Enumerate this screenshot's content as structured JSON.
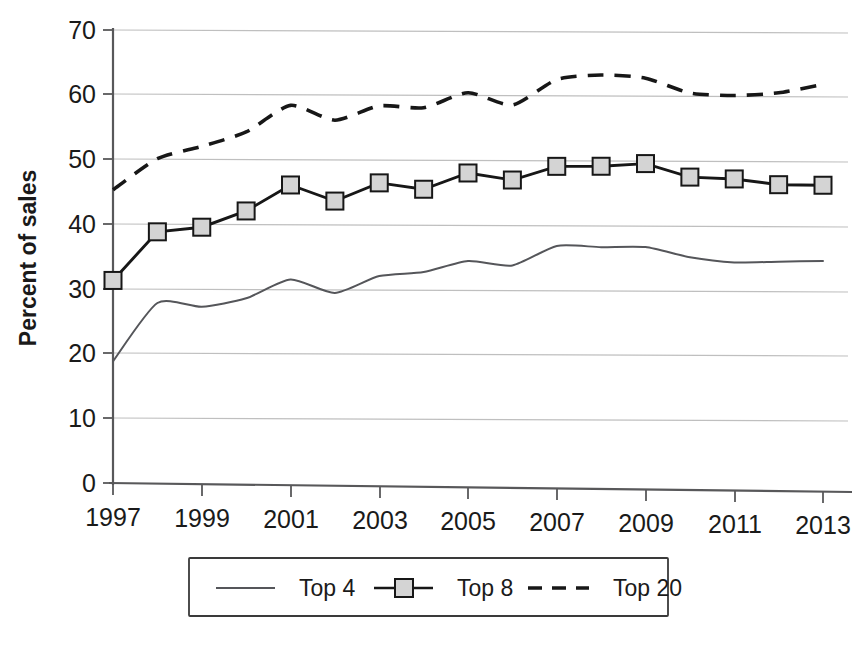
{
  "chart_data": {
    "type": "line",
    "title": "",
    "subtitle": "",
    "xlabel": "",
    "ylabel": "Percent of sales",
    "xlim": [
      1997,
      2013
    ],
    "ylim": [
      0,
      70
    ],
    "grid": true,
    "legend_position": "bottom",
    "x": [
      1997,
      1998,
      1999,
      2000,
      2001,
      2002,
      2003,
      2004,
      2005,
      2006,
      2007,
      2008,
      2009,
      2010,
      2011,
      2012,
      2013
    ],
    "x_tick_labels": [
      "1997",
      "1999",
      "2001",
      "2003",
      "2005",
      "2007",
      "2009",
      "2011",
      "2013"
    ],
    "x_tick_values": [
      1997,
      1999,
      2001,
      2003,
      2005,
      2007,
      2009,
      2011,
      2013
    ],
    "y_tick_labels": [
      "0",
      "10",
      "20",
      "30",
      "40",
      "50",
      "60",
      "70"
    ],
    "y_tick_values": [
      0,
      10,
      20,
      30,
      40,
      50,
      60,
      70
    ],
    "series": [
      {
        "name": "Top 4",
        "style": "thin-solid",
        "marker": "none",
        "color": "#55565a",
        "values": [
          18.8,
          27.9,
          27.4,
          28.8,
          31.8,
          29.8,
          32.5,
          33.2,
          35.0,
          34.4,
          37.5,
          37.4,
          37.5,
          36.0,
          35.3,
          35.5,
          35.7
        ]
      },
      {
        "name": "Top 8",
        "style": "solid",
        "marker": "square",
        "color": "#171717",
        "values": [
          31.3,
          38.9,
          39.7,
          42.3,
          46.4,
          44.0,
          46.9,
          46.0,
          48.6,
          47.6,
          49.8,
          49.9,
          50.4,
          48.4,
          48.2,
          47.4,
          47.4
        ]
      },
      {
        "name": "Top 20",
        "style": "dashed",
        "marker": "none",
        "color": "#171717",
        "values": [
          45.3,
          50.2,
          52.2,
          54.5,
          58.7,
          56.5,
          58.8,
          58.6,
          61.0,
          59.2,
          63.2,
          64.0,
          63.6,
          61.4,
          61.1,
          61.6,
          63.0
        ]
      }
    ]
  },
  "legend": {
    "items": [
      {
        "label": "Top 4",
        "swatch": "thin-line-swatch"
      },
      {
        "label": "Top 8",
        "swatch": "line-square-marker-swatch"
      },
      {
        "label": "Top 20",
        "swatch": "dashed-line-swatch"
      }
    ]
  },
  "colors": {
    "top4": "#55565a",
    "top8": "#171717",
    "top20": "#171717",
    "marker_fill": "#d4d4d4",
    "gridline": "#bfbfbf",
    "axis": "#58585a",
    "background": "#ffffff"
  }
}
